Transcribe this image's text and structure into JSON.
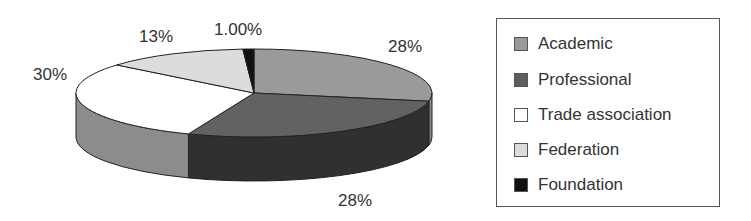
{
  "chart_data": {
    "type": "pie",
    "style": "3d",
    "title": "",
    "categories": [
      "Academic",
      "Professional",
      "Trade association",
      "Federation",
      "Foundation"
    ],
    "values": [
      28,
      28,
      30,
      13,
      1
    ],
    "labels": [
      "28%",
      "28%",
      "30%",
      "13%",
      "1.00%"
    ],
    "colors": {
      "Academic": {
        "top": "#9a9a9a",
        "side": "#8a8a8a"
      },
      "Professional": {
        "top": "#626262",
        "side": "#303030"
      },
      "Trade association": {
        "top": "#ffffff",
        "side": "#8c8c8c"
      },
      "Federation": {
        "top": "#dcdcdc",
        "side": "#c0c0c0"
      },
      "Foundation": {
        "top": "#111111",
        "side": "#000000"
      }
    },
    "legend_position": "right",
    "start_angle": "12 o'clock, clockwise"
  },
  "legend": {
    "items": [
      {
        "label": "Academic",
        "color": "#9a9a9a"
      },
      {
        "label": "Professional",
        "color": "#5e5e5e"
      },
      {
        "label": "Trade association",
        "color": "#ffffff"
      },
      {
        "label": "Federation",
        "color": "#dcdcdc"
      },
      {
        "label": "Foundation",
        "color": "#111111"
      }
    ]
  },
  "slice_labels": {
    "academic": "28%",
    "professional": "28%",
    "trade": "30%",
    "federation": "13%",
    "foundation": "1.00%"
  }
}
